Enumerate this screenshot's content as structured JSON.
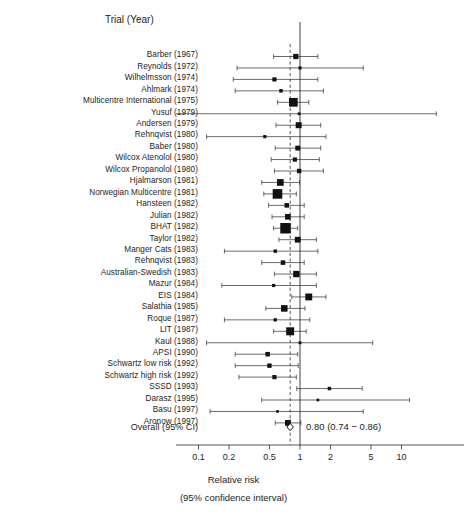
{
  "header": {
    "column_title": "Trial (Year)"
  },
  "axis": {
    "title": "Relative risk",
    "subtitle": "(95% confidence interval)",
    "tick_labels": [
      "0.1",
      "0.2",
      "0.5",
      "1",
      "2",
      "5",
      "10"
    ],
    "tick_values": [
      0.1,
      0.2,
      0.5,
      1,
      2,
      5,
      10
    ],
    "scale": "log",
    "null_value": 1
  },
  "overall": {
    "label": "Overall (95% CI)",
    "text": "0.80 (0.74 − 0.86)",
    "estimate": 0.8,
    "ci_low": 0.74,
    "ci_high": 0.86
  },
  "colors": {
    "ink": "#1d1d1d",
    "marker": "#111111",
    "line": "#2b2b2b",
    "background": "#ffffff"
  },
  "chart_data": {
    "type": "scatter",
    "subtype": "forest-plot",
    "title": "",
    "xlabel": "Relative risk",
    "xlabel_sub": "(95% confidence interval)",
    "ylabel": "Trial (Year)",
    "xscale": "log",
    "xlim": [
      0.07,
      16
    ],
    "xticks": [
      0.1,
      0.2,
      0.5,
      1,
      2,
      5,
      10
    ],
    "xticklabels": [
      "0.1",
      "0.2",
      "0.5",
      "1",
      "2",
      "5",
      "10"
    ],
    "grid": false,
    "legend": "none",
    "reference_line": 1,
    "pooled_line": 0.8,
    "categories": [
      "Barber (1967)",
      "Reynolds (1972)",
      "Wilhelmsson (1974)",
      "Ahlmark (1974)",
      "Multicentre International (1975)",
      "Yusuf (1979)",
      "Andersen (1979)",
      "Rehnqvist (1980)",
      "Baber (1980)",
      "Wilcox Atenolol (1980)",
      "Wilcox Propanolol (1980)",
      "Hjalmarson (1981)",
      "Norwegian Multicentre (1981)",
      "Hansteen (1982)",
      "Julian (1982)",
      "BHAT (1982)",
      "Taylor (1982)",
      "Manger Cats (1983)",
      "Rehnqvist (1983)",
      "Australian-Swedish (1983)",
      "Mazur (1984)",
      "EIS (1984)",
      "Salathia (1985)",
      "Roque (1987)",
      "LIT (1987)",
      "Kaul (1988)",
      "APSI (1990)",
      "Schwartz low risk (1992)",
      "Schwartz high risk (1992)",
      "SSSD (1993)",
      "Darasz (1995)",
      "Basu (1997)",
      "Aronow (1997)"
    ],
    "points": [
      {
        "label": "Barber (1967)",
        "estimate": 0.91,
        "ci_low": 0.55,
        "ci_high": 1.5,
        "weight": 0.34
      },
      {
        "label": "Reynolds (1972)",
        "estimate": 1.0,
        "ci_low": 0.24,
        "ci_high": 4.2,
        "weight": 0.1
      },
      {
        "label": "Wilhelmsson (1974)",
        "estimate": 0.56,
        "ci_low": 0.22,
        "ci_high": 1.5,
        "weight": 0.22
      },
      {
        "label": "Ahlmark (1974)",
        "estimate": 0.65,
        "ci_low": 0.23,
        "ci_high": 1.7,
        "weight": 0.14
      },
      {
        "label": "Multicentre International (1975)",
        "estimate": 0.86,
        "ci_low": 0.6,
        "ci_high": 1.22,
        "weight": 0.72
      },
      {
        "label": "Yusuf (1979)",
        "estimate": 0.98,
        "ci_low": 0.05,
        "ci_high": 22.0,
        "weight": 0.06
      },
      {
        "label": "Andersen (1979)",
        "estimate": 0.97,
        "ci_low": 0.58,
        "ci_high": 1.6,
        "weight": 0.42
      },
      {
        "label": "Rehnqvist (1980)",
        "estimate": 0.45,
        "ci_low": 0.12,
        "ci_high": 1.8,
        "weight": 0.11
      },
      {
        "label": "Baber (1980)",
        "estimate": 0.95,
        "ci_low": 0.57,
        "ci_high": 1.6,
        "weight": 0.3
      },
      {
        "label": "Wilcox Atenolol (1980)",
        "estimate": 0.89,
        "ci_low": 0.52,
        "ci_high": 1.55,
        "weight": 0.22
      },
      {
        "label": "Wilcox Propanolol (1980)",
        "estimate": 0.98,
        "ci_low": 0.56,
        "ci_high": 1.7,
        "weight": 0.24
      },
      {
        "label": "Hjalmarson (1981)",
        "estimate": 0.64,
        "ci_low": 0.42,
        "ci_high": 0.99,
        "weight": 0.5
      },
      {
        "label": "Norwegian Multicentre (1981)",
        "estimate": 0.6,
        "ci_low": 0.44,
        "ci_high": 0.92,
        "weight": 0.82
      },
      {
        "label": "Hansteen (1982)",
        "estimate": 0.74,
        "ci_low": 0.49,
        "ci_high": 1.1,
        "weight": 0.26
      },
      {
        "label": "Julian (1982)",
        "estimate": 0.76,
        "ci_low": 0.53,
        "ci_high": 1.1,
        "weight": 0.38
      },
      {
        "label": "BHAT (1982)",
        "estimate": 0.72,
        "ci_low": 0.55,
        "ci_high": 0.95,
        "weight": 0.92
      },
      {
        "label": "Taylor (1982)",
        "estimate": 0.95,
        "ci_low": 0.62,
        "ci_high": 1.45,
        "weight": 0.4
      },
      {
        "label": "Manger Cats (1983)",
        "estimate": 0.57,
        "ci_low": 0.18,
        "ci_high": 1.5,
        "weight": 0.13
      },
      {
        "label": "Rehnqvist (1983)",
        "estimate": 0.68,
        "ci_low": 0.42,
        "ci_high": 1.1,
        "weight": 0.26
      },
      {
        "label": "Australian-Swedish (1983)",
        "estimate": 0.92,
        "ci_low": 0.56,
        "ci_high": 1.45,
        "weight": 0.46
      },
      {
        "label": "Mazur (1984)",
        "estimate": 0.55,
        "ci_low": 0.17,
        "ci_high": 1.45,
        "weight": 0.11
      },
      {
        "label": "EIS (1984)",
        "estimate": 1.22,
        "ci_low": 0.83,
        "ci_high": 1.8,
        "weight": 0.52
      },
      {
        "label": "Salathia (1985)",
        "estimate": 0.7,
        "ci_low": 0.46,
        "ci_high": 1.12,
        "weight": 0.48
      },
      {
        "label": "Roque (1987)",
        "estimate": 0.57,
        "ci_low": 0.18,
        "ci_high": 1.25,
        "weight": 0.12
      },
      {
        "label": "LIT (1987)",
        "estimate": 0.8,
        "ci_low": 0.55,
        "ci_high": 1.15,
        "weight": 0.64
      },
      {
        "label": "Kaul (1988)",
        "estimate": 1.0,
        "ci_low": 0.12,
        "ci_high": 5.2,
        "weight": 0.07
      },
      {
        "label": "APSI (1990)",
        "estimate": 0.48,
        "ci_low": 0.23,
        "ci_high": 0.95,
        "weight": 0.26
      },
      {
        "label": "Schwartz low risk (1992)",
        "estimate": 0.5,
        "ci_low": 0.23,
        "ci_high": 0.96,
        "weight": 0.24
      },
      {
        "label": "Schwartz high risk (1992)",
        "estimate": 0.56,
        "ci_low": 0.25,
        "ci_high": 0.92,
        "weight": 0.22
      },
      {
        "label": "SSSD (1993)",
        "estimate": 1.95,
        "ci_low": 0.93,
        "ci_high": 4.1,
        "weight": 0.14
      },
      {
        "label": "Darasz (1995)",
        "estimate": 1.5,
        "ci_low": 0.42,
        "ci_high": 12.0,
        "weight": 0.05
      },
      {
        "label": "Basu (1997)",
        "estimate": 0.6,
        "ci_low": 0.13,
        "ci_high": 4.2,
        "weight": 0.05
      },
      {
        "label": "Aronow (1997)",
        "estimate": 0.76,
        "ci_low": 0.57,
        "ci_high": 1.02,
        "weight": 0.4
      }
    ]
  }
}
